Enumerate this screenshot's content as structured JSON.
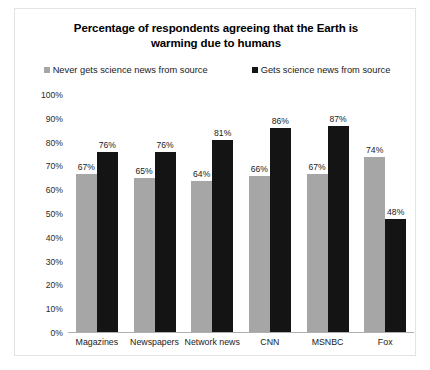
{
  "chart_data": {
    "type": "bar",
    "title": "Percentage of respondents agreeing that the Earth is warming due to humans",
    "title_line1": "Percentage of respondents agreeing that the Earth is",
    "title_line2": "warming due to humans",
    "xlabel": "",
    "ylabel": "",
    "ylim": [
      0,
      100
    ],
    "grid": false,
    "legend_position": "top",
    "categories": [
      "Magazines",
      "Newspapers",
      "Network news",
      "CNN",
      "MSNBC",
      "Fox"
    ],
    "series": [
      {
        "name": "Never gets science news from source",
        "color": "#a6a6a6",
        "values": [
          67,
          65,
          64,
          66,
          67,
          74
        ],
        "labels": [
          "67%",
          "65%",
          "64%",
          "66%",
          "67%",
          "74%"
        ]
      },
      {
        "name": "Gets science news from source",
        "color": "#141414",
        "values": [
          76,
          76,
          81,
          86,
          87,
          48
        ],
        "labels": [
          "76%",
          "76%",
          "81%",
          "86%",
          "87%",
          "48%"
        ]
      }
    ],
    "y_ticks": [
      {
        "value": 100,
        "label": "100%"
      },
      {
        "value": 90,
        "label": "90%"
      },
      {
        "value": 80,
        "label": "80%"
      },
      {
        "value": 70,
        "label": "70%"
      },
      {
        "value": 60,
        "label": "60%"
      },
      {
        "value": 50,
        "label": "50%"
      },
      {
        "value": 40,
        "label": "40%"
      },
      {
        "value": 30,
        "label": "30%"
      },
      {
        "value": 20,
        "label": "20%"
      },
      {
        "value": 10,
        "label": "10%"
      },
      {
        "value": 0,
        "label": "0%"
      }
    ]
  }
}
